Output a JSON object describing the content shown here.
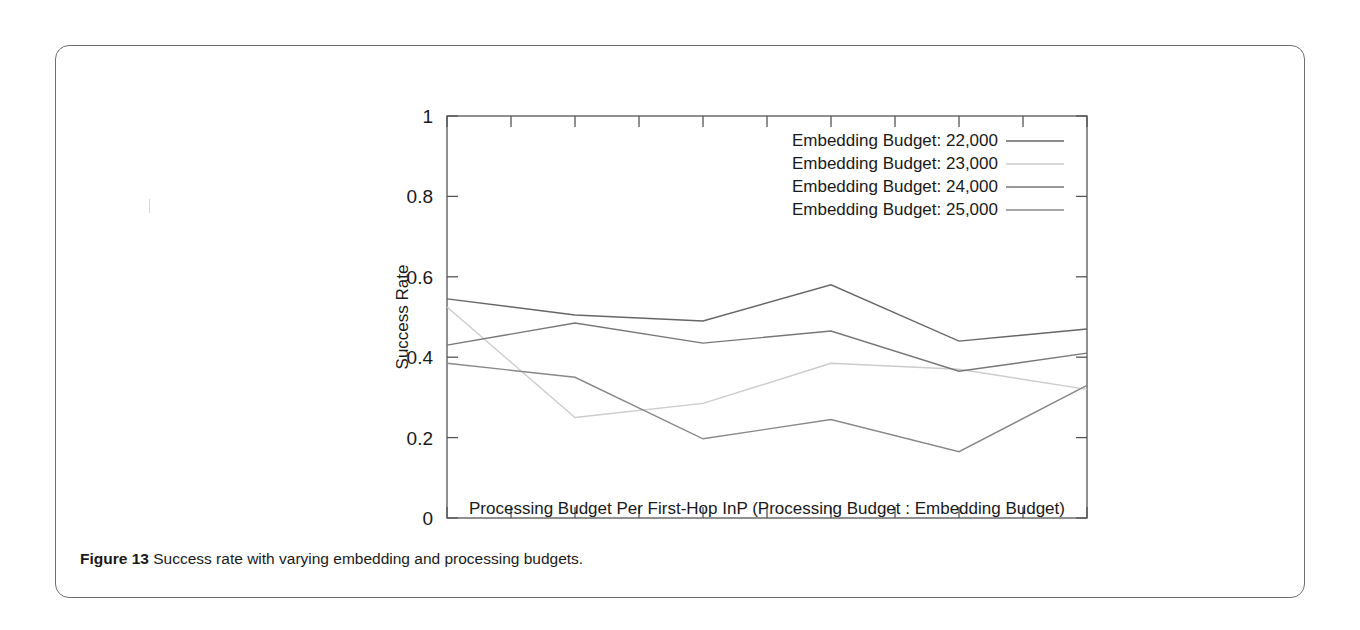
{
  "figure": {
    "caption_lead": "Figure 13",
    "caption_text": "Success rate with varying embedding and processing budgets."
  },
  "chart_data": {
    "type": "line",
    "title": "",
    "xlabel": "Processing Budget Per First-Hop InP (Processing Budget : Embedding Budget)",
    "ylabel": "Success Rate",
    "xlim": [
      0.2,
      0.25
    ],
    "ylim": [
      0,
      1
    ],
    "xticks": [
      "0.2",
      "0.205",
      "0.21",
      "0.215",
      "0.22",
      "0.225",
      "0.23",
      "0.235",
      "0.24",
      "0.245",
      "0.25"
    ],
    "xtick_values": [
      0.2,
      0.205,
      0.21,
      0.215,
      0.22,
      0.225,
      0.23,
      0.235,
      0.24,
      0.245,
      0.25
    ],
    "yticks": [
      "0",
      "0.2",
      "0.4",
      "0.6",
      "0.8",
      "1"
    ],
    "ytick_values": [
      0,
      0.2,
      0.4,
      0.6,
      0.8,
      1
    ],
    "grid": false,
    "legend_position": "top-right",
    "x": [
      0.2,
      0.21,
      0.22,
      0.23,
      0.24,
      0.25
    ],
    "series": [
      {
        "name": "Embedding Budget: 22,000",
        "color": "#666666",
        "values": [
          0.545,
          0.505,
          0.49,
          0.58,
          0.44,
          0.47
        ]
      },
      {
        "name": "Embedding Budget: 23,000",
        "color": "#cccccc",
        "values": [
          0.525,
          0.25,
          0.285,
          0.385,
          0.37,
          0.32
        ]
      },
      {
        "name": "Embedding Budget: 24,000",
        "color": "#777777",
        "values": [
          0.43,
          0.485,
          0.435,
          0.465,
          0.365,
          0.41
        ]
      },
      {
        "name": "Embedding Budget: 25,000",
        "color": "#888888",
        "values": [
          0.385,
          0.35,
          0.197,
          0.245,
          0.165,
          0.33
        ]
      }
    ]
  }
}
